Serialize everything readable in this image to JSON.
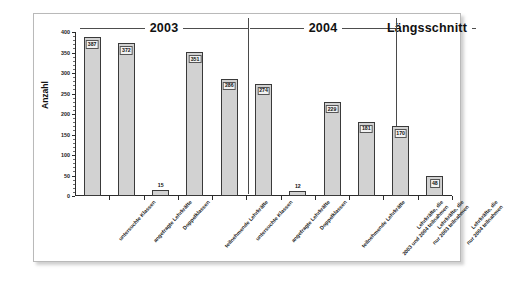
{
  "chart_data": {
    "type": "bar",
    "title": "",
    "xlabel": "",
    "ylabel": "Anzahl",
    "ylim": [
      0,
      400
    ],
    "ytick_step": 50,
    "yticks": [
      0,
      50,
      100,
      150,
      200,
      250,
      300,
      350,
      400
    ],
    "ytick_labels": [
      "0",
      "50",
      "100",
      "150",
      "200",
      "250",
      "300",
      "350",
      "400"
    ],
    "grid": false,
    "legend": "none",
    "bar_color": "#d2d2d2",
    "bar_edge_color": "#3a3a3a",
    "groups": [
      {
        "label": "2003",
        "start": 0,
        "end": 3
      },
      {
        "label": "2004",
        "start": 4,
        "end": 7
      },
      {
        "label": "Längsschnitt",
        "start": 8,
        "end": 10
      }
    ],
    "categories": [
      "untersuchte Klassen",
      "angefragte Lehrkräfte",
      "Doppelklassen",
      "teilnehmende Lehrkräfte",
      "untersuchte Klassen",
      "angefragte Lehrkräfte",
      "Doppelklassen",
      "teilnehmende Lehrkräfte",
      "Lehrkräfte, die 2003 und 2004 teilnahmen",
      "Lehrkräfte, die nur 2003 teilnahmen",
      "Lehrkräfte, die nur 2004 teilnahmen"
    ],
    "category_lines": [
      [
        "untersuchte Klassen"
      ],
      [
        "angefragte Lehrkräfte"
      ],
      [
        "Doppelklassen"
      ],
      [
        "teilnehmende Lehrkräfte"
      ],
      [
        "untersuchte Klassen"
      ],
      [
        "angefragte Lehrkräfte"
      ],
      [
        "Doppelklassen"
      ],
      [
        "teilnehmende Lehrkräfte"
      ],
      [
        "Lehrkräfte, die",
        "2003 und 2004 teilnahmen"
      ],
      [
        "Lehrkräfte, die",
        "nur 2003 teilnahmen"
      ],
      [
        "Lehrkräfte, die",
        "nur 2004 teilnahmen"
      ]
    ],
    "values": [
      387,
      372,
      15,
      351,
      286,
      274,
      12,
      229,
      181,
      170,
      48
    ],
    "value_labels": [
      "387",
      "372",
      "15",
      "351",
      "286",
      "274",
      "12",
      "229",
      "181",
      "170",
      "48"
    ]
  }
}
